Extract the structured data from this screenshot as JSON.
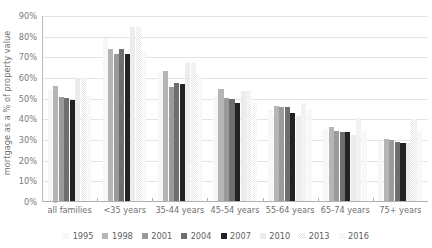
{
  "chart_data": {
    "type": "bar",
    "title": "",
    "xlabel": "",
    "ylabel": "mortgage as a % of property value",
    "ylim": [
      0,
      90
    ],
    "ytick_labels": [
      "0%",
      "10%",
      "20%",
      "30%",
      "40%",
      "50%",
      "60%",
      "70%",
      "80%",
      "90%"
    ],
    "ytick_values": [
      0,
      10,
      20,
      30,
      40,
      50,
      60,
      70,
      80,
      90
    ],
    "grid": true,
    "legend_position": "bottom",
    "categories": [
      "all families",
      "<35 years",
      "35-44 years",
      "45-54 years",
      "55-64 years",
      "65-74 years",
      "75+ years"
    ],
    "series": [
      {
        "name": "1995",
        "color": "#efefef",
        "pattern": "dotted",
        "values": [
          54,
          79,
          62,
          51,
          44,
          35,
          29
        ]
      },
      {
        "name": "1998",
        "color": "#b5b5b5",
        "pattern": "solid",
        "values": [
          55.5,
          73.5,
          63,
          54,
          46,
          36,
          30
        ]
      },
      {
        "name": "2001",
        "color": "#9a9a9a",
        "pattern": "solid",
        "values": [
          50.5,
          71,
          55,
          50,
          45.5,
          34,
          29.5
        ]
      },
      {
        "name": "2004",
        "color": "#6e6e6e",
        "pattern": "solid",
        "values": [
          50,
          73.5,
          57,
          49.5,
          45.5,
          33.5,
          28.5
        ]
      },
      {
        "name": "2007",
        "color": "#222222",
        "pattern": "solid",
        "values": [
          49,
          71,
          56.5,
          47.5,
          42.5,
          33.5,
          28
        ]
      },
      {
        "name": "2010",
        "color": "#ececec",
        "pattern": "solid",
        "values": [
          59.5,
          84,
          67,
          53,
          41,
          32,
          28
        ]
      },
      {
        "name": "2013",
        "color": "#e6e6e6",
        "pattern": "dotted",
        "values": [
          59.5,
          84,
          67,
          53,
          47.5,
          40,
          39.5
        ]
      },
      {
        "name": "2016",
        "color": "#f1f1f1",
        "pattern": "dotted",
        "values": [
          51.5,
          72,
          60.5,
          48,
          44,
          34,
          34
        ]
      }
    ]
  }
}
